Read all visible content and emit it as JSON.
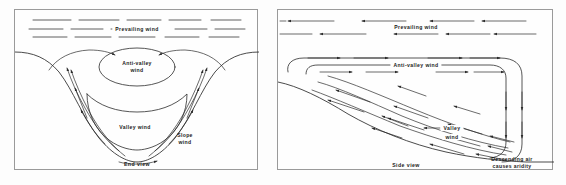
{
  "figure": {
    "background_color": "#fdfdfd",
    "line_color": "#2b2b2b",
    "panel_border_color": "#9a9a9a"
  },
  "panels": [
    {
      "id": "end-view",
      "caption": "End view",
      "labels": {
        "prevailing_wind": "Prevailing wind",
        "anti_valley_wind_line1": "Anti-valley",
        "anti_valley_wind_line2": "wind",
        "valley_wind": "Valley wind",
        "slope_wind_line1": "Slope",
        "slope_wind_line2": "wind"
      }
    },
    {
      "id": "side-view",
      "caption": "Side view",
      "labels": {
        "prevailing_wind": "Prevailing wind",
        "anti_valley_wind": "Anti-valley wind",
        "valley_wind_line1": "Valley",
        "valley_wind_line2": "wind",
        "descending_air_line1": "Descending air",
        "descending_air_line2": "causes aridity"
      }
    }
  ]
}
